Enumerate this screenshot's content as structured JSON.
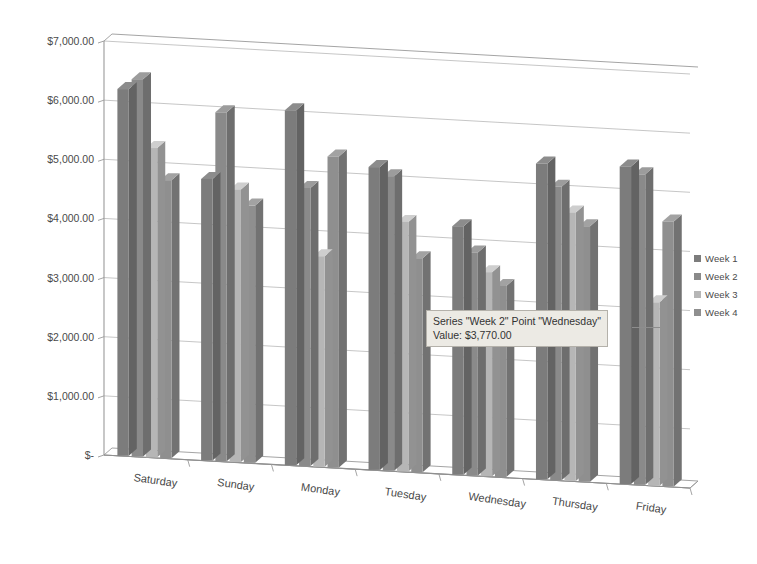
{
  "chart_data": {
    "type": "bar",
    "title": "",
    "xlabel": "",
    "ylabel": "",
    "grid": true,
    "three_d": true,
    "legend_position": "right",
    "ylim": [
      0,
      7000
    ],
    "y_ticks": [
      0,
      1000,
      2000,
      3000,
      4000,
      5000,
      6000,
      7000
    ],
    "y_tick_labels": [
      "$-",
      "$1,000.00",
      "$2,000.00",
      "$3,000.00",
      "$4,000.00",
      "$5,000.00",
      "$6,000.00",
      "$7,000.00"
    ],
    "categories": [
      "Saturday",
      "Sunday",
      "Monday",
      "Tuesday",
      "Wednesday",
      "Thursday",
      "Friday"
    ],
    "series": [
      {
        "name": "Week 1",
        "color": "#7c7c7c",
        "values": [
          6200,
          4760,
          6000,
          5120,
          4200,
          5340,
          5370
        ]
      },
      {
        "name": "Week 2",
        "color": "#8a8a8a",
        "values": [
          6380,
          5900,
          4700,
          4980,
          3770,
          4960,
          5250
        ]
      },
      {
        "name": "Week 3",
        "color": "#b6b6b6",
        "values": [
          5230,
          4610,
          3560,
          4220,
          3450,
          4540,
          3100
        ]
      },
      {
        "name": "Week 4",
        "color": "#8f8f8f",
        "values": [
          4700,
          4350,
          5260,
          3620,
          3230,
          4320,
          4480
        ]
      }
    ]
  },
  "legend": {
    "items": [
      {
        "label": "Week 1",
        "color": "#7c7c7c"
      },
      {
        "label": "Week 2",
        "color": "#8a8a8a"
      },
      {
        "label": "Week 3",
        "color": "#b6b6b6"
      },
      {
        "label": "Week 4",
        "color": "#8f8f8f"
      }
    ]
  },
  "tooltip": {
    "line1": "Series \"Week 2\" Point \"Wednesday\"",
    "line2": "Value:  $3,770.00",
    "series": "Week 2",
    "point": "Wednesday",
    "value": "$3,770.00"
  }
}
